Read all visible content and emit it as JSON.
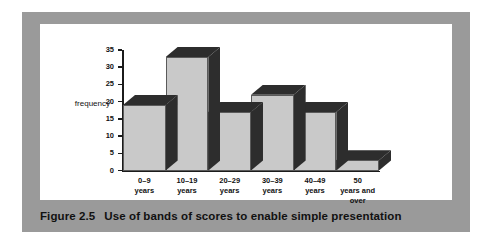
{
  "figure": {
    "caption_number": "Figure 2.5",
    "caption_text": "Use of bands of scores to enable simple presentation",
    "panel_color": "#9a9a9a",
    "card_color": "#ffffff"
  },
  "chart_data": {
    "type": "bar",
    "title": "",
    "subtitle": "",
    "xlabel": "",
    "ylabel": "frequency",
    "categories": [
      "0–9 years",
      "10–19 years",
      "20–29 years",
      "30–39 years",
      "40–49 years",
      "50 years and over"
    ],
    "category_lines": [
      [
        "0–9",
        "years"
      ],
      [
        "10–19",
        "years"
      ],
      [
        "20–29",
        "years"
      ],
      [
        "30–39",
        "years"
      ],
      [
        "40–49",
        "years"
      ],
      [
        "50",
        "years and",
        "over"
      ]
    ],
    "values": [
      19,
      33,
      17,
      22,
      17,
      3
    ],
    "ylim": [
      0,
      35
    ],
    "yticks": [
      0,
      5,
      10,
      15,
      20,
      25,
      30,
      35
    ],
    "ytick_labels": [
      "0",
      "5",
      "10",
      "15",
      "20",
      "25",
      "30",
      "35"
    ],
    "grid": false,
    "legend": false,
    "three_d": true,
    "bar_face_color": "#c9c9c9",
    "bar_shadow_color": "#2d2d2d",
    "axis_color": "#1b1b1b"
  }
}
